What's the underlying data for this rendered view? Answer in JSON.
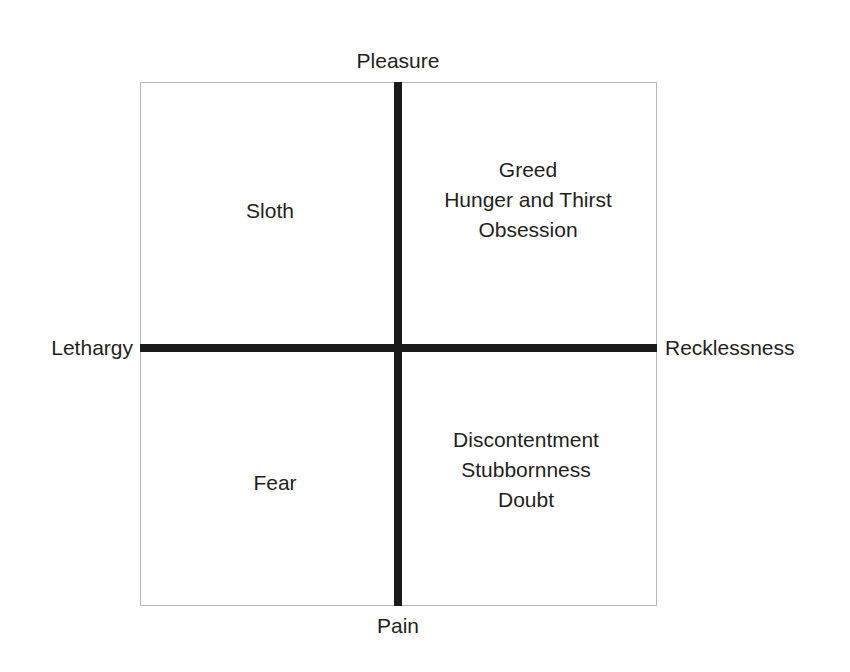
{
  "diagram": {
    "type": "two-axis quadrant chart",
    "axes": {
      "vertical": {
        "top_label": "Pleasure",
        "bottom_label": "Pain"
      },
      "horizontal": {
        "left_label": "Lethargy",
        "right_label": "Recklessness"
      }
    },
    "quadrants": {
      "top_left": {
        "name": "Pleasure / Lethargy",
        "items": [
          "Sloth"
        ]
      },
      "top_right": {
        "name": "Pleasure / Recklessness",
        "items": [
          "Greed",
          "Hunger and Thirst",
          "Obsession"
        ]
      },
      "bottom_left": {
        "name": "Pain / Lethargy",
        "items": [
          "Fear"
        ]
      },
      "bottom_right": {
        "name": "Pain / Recklessness",
        "items": [
          "Discontentment",
          "Stubbornness",
          "Doubt"
        ]
      }
    },
    "colors": {
      "axis": "#1a1a1a",
      "border": "#b8b8b8",
      "text": "#231f20",
      "background": "#ffffff"
    }
  }
}
